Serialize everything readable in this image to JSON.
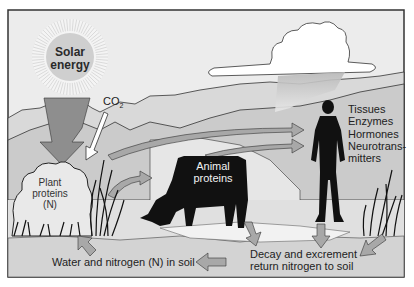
{
  "diagram": {
    "sun": {
      "label_line1": "Solar",
      "label_line2": "energy"
    },
    "co2": {
      "label": "CO",
      "subscript": "2"
    },
    "plant": {
      "line1": "Plant",
      "line2": "proteins",
      "line3": "(N)"
    },
    "animal": {
      "line1": "Animal",
      "line2": "proteins"
    },
    "human": {
      "lines": [
        "Tissues",
        "Enzymes",
        "Hormones",
        "Neurotrans-",
        "mitters"
      ]
    },
    "soil": {
      "label": "Water and nitrogen (N) in soil"
    },
    "decay": {
      "line1": "Decay and excrement",
      "line2": "return nitrogen to soil"
    },
    "colors": {
      "sky": "#ebebeb",
      "hills_far": "#d8d8d8",
      "hills_near": "#c9c9c9",
      "ground": "#e3e3e3",
      "soil_band": "#d3d3d3",
      "sun": "#cfcfcf",
      "arrow_fill": "#a8a8a8",
      "silhouette": "#111111",
      "frame": "#333333"
    }
  }
}
